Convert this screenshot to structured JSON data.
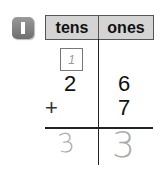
{
  "problem": {
    "number": "1"
  },
  "table": {
    "headers": [
      "tens",
      "ones"
    ],
    "carry": "1",
    "rows": [
      {
        "operator": "",
        "tens": "2",
        "ones": "6"
      },
      {
        "operator": "+",
        "tens": "",
        "ones": "7"
      }
    ],
    "answer": {
      "tens": "3",
      "ones": "3"
    }
  }
}
